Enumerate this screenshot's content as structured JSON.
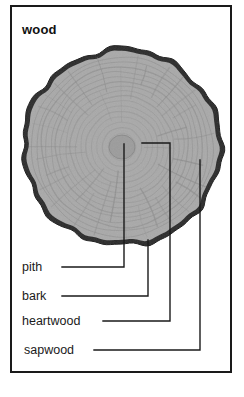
{
  "figure": {
    "title": "wood",
    "frame": {
      "x": 10,
      "y": 5,
      "width": 222,
      "height": 368,
      "border_color": "#1a1a1a"
    }
  },
  "diagram": {
    "disc": {
      "center_x": 122,
      "center_y": 147,
      "radius_x": 100,
      "radius_y": 99,
      "wood_color": "#a9a9a9",
      "bark_color": "#2b2b2b",
      "ring_color": "#8a8a8a",
      "pith_color": "#9a9a9a",
      "ring_count": 17
    }
  },
  "labels": [
    {
      "id": "pith",
      "text": "pith",
      "text_x": 22,
      "text_y": 267,
      "leader": {
        "label_end_x": 62,
        "label_y": 267,
        "elbow_x": 124,
        "target_x": 124,
        "target_y": 144
      }
    },
    {
      "id": "bark",
      "text": "bark",
      "text_x": 22,
      "text_y": 296,
      "leader": {
        "label_end_x": 62,
        "label_y": 296,
        "elbow_x": 148,
        "target_x": 148,
        "target_y": 240
      }
    },
    {
      "id": "heartwood",
      "text": "heartwood",
      "text_x": 22,
      "text_y": 321,
      "leader": {
        "label_end_x": 103,
        "label_y": 321,
        "elbow_x": 170,
        "target_x": 142,
        "target_y": 143
      }
    },
    {
      "id": "sapwood",
      "text": "sapwood",
      "text_x": 24,
      "text_y": 350,
      "leader": {
        "label_end_x": 94,
        "label_y": 350,
        "elbow_x": 200,
        "target_x": 200,
        "target_y": 160
      }
    }
  ],
  "colors": {
    "ink": "#1a1a1a",
    "paper": "#ffffff",
    "wood": "#a9a9a9",
    "bark": "#2b2b2b"
  }
}
